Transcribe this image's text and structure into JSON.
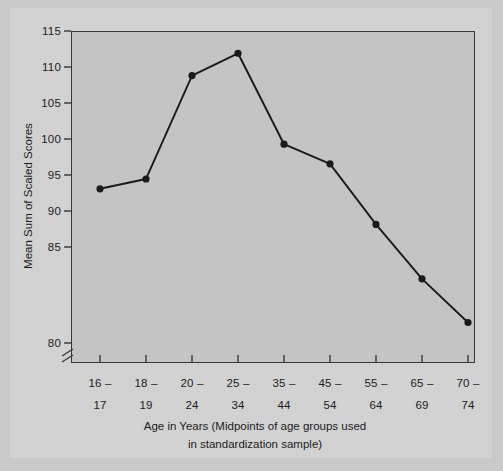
{
  "chart_data": {
    "type": "line",
    "title": "",
    "subtitle": "",
    "xlabel_line1": "Age in Years (Midpoints of age groups used",
    "xlabel_line2": "in standardization sample)",
    "ylabel": "Mean Sum of Scaled Scores",
    "categories": [
      "16 –\n17",
      "18 –\n19",
      "20 –\n24",
      "25 –\n34",
      "35 –\n44",
      "45 –\n54",
      "55 –\n64",
      "65 –\n69",
      "70 –\n74"
    ],
    "category_top": [
      "16 –",
      "18 –",
      "20 –",
      "25 –",
      "35 –",
      "45 –",
      "55 –",
      "65 –",
      "70 –"
    ],
    "category_bottom": [
      "17",
      "19",
      "24",
      "34",
      "44",
      "54",
      "64",
      "69",
      "74"
    ],
    "values": [
      97.3,
      98.4,
      110.0,
      112.5,
      102.3,
      100.1,
      93.3,
      87.2,
      82.3
    ],
    "series": [
      {
        "name": "Mean Sum of Scaled Scores",
        "values": [
          97.3,
          98.4,
          110.0,
          112.5,
          102.3,
          100.1,
          93.3,
          87.2,
          82.3
        ]
      }
    ],
    "ylim": [
      80,
      115
    ],
    "yticks": [
      80,
      85,
      90,
      95,
      100,
      105,
      110,
      115
    ],
    "ytick_labels": [
      "80",
      "85",
      "90",
      "95",
      "100",
      "105",
      "110",
      "115"
    ],
    "grid": false,
    "legend": false,
    "legend_position": "none",
    "axis_break": true,
    "axis_break_note": "y-axis broken below 80",
    "marker": "filled-circle",
    "line_color": "#1a1a1a",
    "marker_color": "#1a1a1a",
    "plot_background": "#c4c4c4",
    "page_background": "#d2d2d2",
    "axis_color": "#39393b"
  }
}
